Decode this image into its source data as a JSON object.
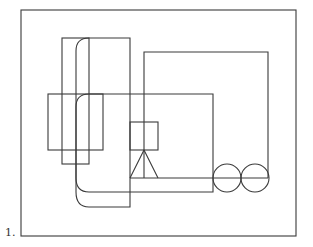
{
  "figure": {
    "label": "1.",
    "label_pos": {
      "x": 5,
      "y": 227
    },
    "stroke_color": "#3a3a3a",
    "background": "#ffffff"
  },
  "shapes": {
    "outer_frame": {
      "x": 21,
      "y": 10,
      "w": 275,
      "h": 226
    },
    "tall_rect_narrow": {
      "x": 62,
      "y": 38,
      "w": 27,
      "h": 126
    },
    "tall_rect_wide_right_edge": {
      "x": 130,
      "y_top": 38,
      "y_bottom": 207
    },
    "wide_rect": {
      "x": 48,
      "y": 94,
      "w": 55,
      "h": 56
    },
    "large_rect_right": {
      "x_right": 213,
      "y_top": 94,
      "y_bottom": 192
    },
    "right_rect": {
      "x": 144,
      "y": 52,
      "w": 124,
      "h": 126
    },
    "small_box": {
      "x": 130,
      "y": 122,
      "w": 28,
      "h": 28
    },
    "triangle": {
      "apex": [
        144,
        150
      ],
      "base_left": [
        130,
        178
      ],
      "base_right": [
        158,
        178
      ]
    },
    "circles": [
      {
        "cx": 227,
        "cy": 178,
        "r": 14
      },
      {
        "cx": 255,
        "cy": 178,
        "r": 14
      }
    ],
    "horizontal_line": {
      "x1": 130,
      "x2": 268,
      "y": 178
    }
  }
}
